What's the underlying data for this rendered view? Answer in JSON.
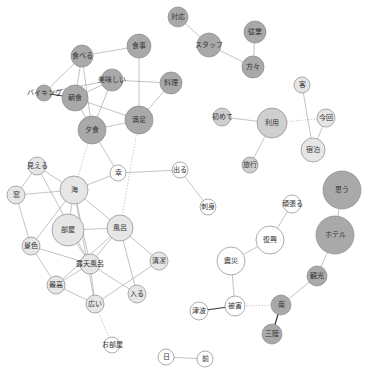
{
  "diagram": {
    "type": "co-occurrence-network",
    "colors": {
      "dark": "#a9a9a9",
      "medium": "#cfcfcf",
      "light": "#e6e6e6",
      "white": "#ffffff",
      "edge": "#9a9a9a",
      "edge_strong": "#333333"
    },
    "nodes": [
      {
        "id": "taiou",
        "label": "対応",
        "x": 178,
        "y": 17,
        "r": 10,
        "fill": "dark"
      },
      {
        "id": "staff",
        "label": "スタッフ",
        "x": 209,
        "y": 45,
        "r": 12,
        "fill": "dark"
      },
      {
        "id": "jugyo",
        "label": "従業",
        "x": 255,
        "y": 32,
        "r": 11,
        "fill": "dark"
      },
      {
        "id": "katagata",
        "label": "方々",
        "x": 253,
        "y": 67,
        "r": 11,
        "fill": "dark"
      },
      {
        "id": "taberu",
        "label": "食べる",
        "x": 82,
        "y": 56,
        "r": 11,
        "fill": "dark"
      },
      {
        "id": "shokuji",
        "label": "食事",
        "x": 139,
        "y": 46,
        "r": 12,
        "fill": "dark"
      },
      {
        "id": "ryori",
        "label": "料理",
        "x": 171,
        "y": 83,
        "r": 11,
        "fill": "dark"
      },
      {
        "id": "oishii",
        "label": "美味しい",
        "x": 112,
        "y": 80,
        "r": 11,
        "fill": "dark"
      },
      {
        "id": "viking",
        "label": "バイキング",
        "x": 44,
        "y": 93,
        "r": 8,
        "fill": "dark"
      },
      {
        "id": "choshoku",
        "label": "朝食",
        "x": 75,
        "y": 98,
        "r": 13,
        "fill": "dark"
      },
      {
        "id": "manzoku",
        "label": "満足",
        "x": 139,
        "y": 120,
        "r": 14,
        "fill": "dark"
      },
      {
        "id": "yushoku",
        "label": "夕食",
        "x": 92,
        "y": 130,
        "r": 14,
        "fill": "dark"
      },
      {
        "id": "riyo",
        "label": "利用",
        "x": 272,
        "y": 123,
        "r": 15,
        "fill": "medium"
      },
      {
        "id": "hajimete",
        "label": "初めて",
        "x": 222,
        "y": 117,
        "r": 9,
        "fill": "medium"
      },
      {
        "id": "kyaku",
        "label": "客",
        "x": 302,
        "y": 85,
        "r": 8,
        "fill": "light"
      },
      {
        "id": "konkai",
        "label": "今回",
        "x": 326,
        "y": 118,
        "r": 9,
        "fill": "light"
      },
      {
        "id": "shukuhaku",
        "label": "宿泊",
        "x": 313,
        "y": 150,
        "r": 12,
        "fill": "light"
      },
      {
        "id": "ryoko",
        "label": "旅行",
        "x": 250,
        "y": 165,
        "r": 8,
        "fill": "medium"
      },
      {
        "id": "sachi",
        "label": "幸",
        "x": 118,
        "y": 173,
        "r": 8,
        "fill": "white"
      },
      {
        "id": "deru",
        "label": "出る",
        "x": 180,
        "y": 170,
        "r": 8,
        "fill": "white"
      },
      {
        "id": "sashimi",
        "label": "刺身",
        "x": 208,
        "y": 207,
        "r": 8,
        "fill": "white"
      },
      {
        "id": "mieru",
        "label": "見える",
        "x": 37,
        "y": 166,
        "r": 9,
        "fill": "light"
      },
      {
        "id": "mado",
        "label": "窓",
        "x": 16,
        "y": 195,
        "r": 9,
        "fill": "light"
      },
      {
        "id": "umi",
        "label": "海",
        "x": 74,
        "y": 190,
        "r": 14,
        "fill": "light"
      },
      {
        "id": "heya",
        "label": "部屋",
        "x": 68,
        "y": 230,
        "r": 16,
        "fill": "light"
      },
      {
        "id": "furo",
        "label": "風呂",
        "x": 120,
        "y": 228,
        "r": 13,
        "fill": "light"
      },
      {
        "id": "keshiki",
        "label": "景色",
        "x": 31,
        "y": 246,
        "r": 9,
        "fill": "light"
      },
      {
        "id": "rotenburo",
        "label": "露天風呂",
        "x": 90,
        "y": 264,
        "r": 10,
        "fill": "light"
      },
      {
        "id": "seiketsu",
        "label": "清潔",
        "x": 159,
        "y": 261,
        "r": 9,
        "fill": "light"
      },
      {
        "id": "saiko",
        "label": "最高",
        "x": 56,
        "y": 285,
        "r": 9,
        "fill": "light"
      },
      {
        "id": "hairu",
        "label": "入る",
        "x": 137,
        "y": 294,
        "r": 9,
        "fill": "light"
      },
      {
        "id": "hiroi",
        "label": "広い",
        "x": 95,
        "y": 304,
        "r": 9,
        "fill": "light"
      },
      {
        "id": "oheya",
        "label": "お部屋",
        "x": 112,
        "y": 345,
        "r": 8,
        "fill": "white"
      },
      {
        "id": "ganbaru",
        "label": "頑張る",
        "x": 292,
        "y": 204,
        "r": 9,
        "fill": "white"
      },
      {
        "id": "omou",
        "label": "思う",
        "x": 342,
        "y": 190,
        "r": 19,
        "fill": "dark"
      },
      {
        "id": "fukko",
        "label": "復興",
        "x": 270,
        "y": 240,
        "r": 14,
        "fill": "white"
      },
      {
        "id": "hotel",
        "label": "ホテル",
        "x": 335,
        "y": 235,
        "r": 19,
        "fill": "dark"
      },
      {
        "id": "shinsai",
        "label": "震災",
        "x": 231,
        "y": 261,
        "r": 14,
        "fill": "white"
      },
      {
        "id": "kanko",
        "label": "観光",
        "x": 317,
        "y": 276,
        "r": 10,
        "fill": "dark"
      },
      {
        "id": "minami",
        "label": "南",
        "x": 281,
        "y": 305,
        "r": 10,
        "fill": "dark"
      },
      {
        "id": "higai",
        "label": "被害",
        "x": 235,
        "y": 306,
        "r": 10,
        "fill": "white"
      },
      {
        "id": "tsunami",
        "label": "津波",
        "x": 199,
        "y": 311,
        "r": 9,
        "fill": "white"
      },
      {
        "id": "sanriku",
        "label": "三陸",
        "x": 272,
        "y": 334,
        "r": 10,
        "fill": "dark"
      },
      {
        "id": "hi",
        "label": "日",
        "x": 166,
        "y": 357,
        "r": 8,
        "fill": "white"
      },
      {
        "id": "mae",
        "label": "前",
        "x": 205,
        "y": 359,
        "r": 8,
        "fill": "white"
      }
    ],
    "edges": [
      {
        "s": "taiou",
        "t": "staff"
      },
      {
        "s": "staff",
        "t": "katagata"
      },
      {
        "s": "jugyo",
        "t": "katagata"
      },
      {
        "s": "taberu",
        "t": "shokuji"
      },
      {
        "s": "taberu",
        "t": "viking"
      },
      {
        "s": "taberu",
        "t": "choshoku"
      },
      {
        "s": "taberu",
        "t": "yushoku"
      },
      {
        "s": "shokuji",
        "t": "manzoku"
      },
      {
        "s": "ryori",
        "t": "oishii"
      },
      {
        "s": "ryori",
        "t": "manzoku"
      },
      {
        "s": "oishii",
        "t": "viking"
      },
      {
        "s": "oishii",
        "t": "choshoku"
      },
      {
        "s": "oishii",
        "t": "yushoku"
      },
      {
        "s": "viking",
        "t": "choshoku",
        "style": "strong"
      },
      {
        "s": "choshoku",
        "t": "manzoku"
      },
      {
        "s": "choshoku",
        "t": "yushoku"
      },
      {
        "s": "yushoku",
        "t": "manzoku"
      },
      {
        "s": "yushoku",
        "t": "sachi"
      },
      {
        "s": "yushoku",
        "t": "umi",
        "style": "dotted"
      },
      {
        "s": "manzoku",
        "t": "furo",
        "style": "dotted"
      },
      {
        "s": "hajimete",
        "t": "riyo"
      },
      {
        "s": "riyo",
        "t": "ryoko"
      },
      {
        "s": "riyo",
        "t": "konkai",
        "style": "dotted"
      },
      {
        "s": "kyaku",
        "t": "shukuhaku"
      },
      {
        "s": "konkai",
        "t": "shukuhaku"
      },
      {
        "s": "sachi",
        "t": "deru"
      },
      {
        "s": "sachi",
        "t": "umi"
      },
      {
        "s": "deru",
        "t": "sashimi"
      },
      {
        "s": "mieru",
        "t": "mado"
      },
      {
        "s": "mieru",
        "t": "umi"
      },
      {
        "s": "mieru",
        "t": "rotenburo"
      },
      {
        "s": "mado",
        "t": "umi"
      },
      {
        "s": "mado",
        "t": "keshiki"
      },
      {
        "s": "umi",
        "t": "heya"
      },
      {
        "s": "umi",
        "t": "furo"
      },
      {
        "s": "umi",
        "t": "rotenburo"
      },
      {
        "s": "umi",
        "t": "keshiki"
      },
      {
        "s": "umi",
        "t": "hiroi"
      },
      {
        "s": "heya",
        "t": "furo"
      },
      {
        "s": "heya",
        "t": "rotenburo"
      },
      {
        "s": "keshiki",
        "t": "rotenburo"
      },
      {
        "s": "keshiki",
        "t": "saiko"
      },
      {
        "s": "furo",
        "t": "rotenburo"
      },
      {
        "s": "furo",
        "t": "seiketsu"
      },
      {
        "s": "furo",
        "t": "hairu"
      },
      {
        "s": "furo",
        "t": "saiko"
      },
      {
        "s": "rotenburo",
        "t": "saiko"
      },
      {
        "s": "rotenburo",
        "t": "hairu"
      },
      {
        "s": "rotenburo",
        "t": "hiroi"
      },
      {
        "s": "seiketsu",
        "t": "hiroi"
      },
      {
        "s": "saiko",
        "t": "hiroi"
      },
      {
        "s": "hiroi",
        "t": "oheya",
        "style": "dotted"
      },
      {
        "s": "ganbaru",
        "t": "fukko"
      },
      {
        "s": "omou",
        "t": "hotel"
      },
      {
        "s": "fukko",
        "t": "shinsai"
      },
      {
        "s": "shinsai",
        "t": "higai"
      },
      {
        "s": "hotel",
        "t": "kanko"
      },
      {
        "s": "kanko",
        "t": "minami"
      },
      {
        "s": "minami",
        "t": "higai",
        "style": "dotted"
      },
      {
        "s": "minami",
        "t": "sanriku",
        "style": "strong"
      },
      {
        "s": "higai",
        "t": "tsunami",
        "style": "strong"
      },
      {
        "s": "hi",
        "t": "mae"
      }
    ]
  }
}
